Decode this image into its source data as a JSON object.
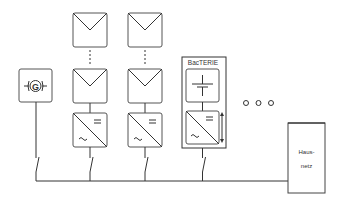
{
  "diagram": {
    "type": "power system schematic",
    "nodes": [
      {
        "id": "generator",
        "kind": "generator",
        "symbol": "G"
      },
      {
        "id": "pv_string_1",
        "kind": "pv_string",
        "modules": 2,
        "inverter": "DC/AC"
      },
      {
        "id": "pv_string_2",
        "kind": "pv_string",
        "modules": 2,
        "inverter": "DC/AC"
      },
      {
        "id": "battery_unit",
        "kind": "battery_system",
        "label": "BacTERIE",
        "inverter": "DC/AC bidirectional"
      },
      {
        "id": "more",
        "kind": "ellipsis",
        "label": "o o o"
      },
      {
        "id": "grid",
        "kind": "house_grid",
        "label_line1": "Haus-",
        "label_line2": "netz"
      }
    ],
    "edges": [
      {
        "from": "generator",
        "to": "bus",
        "switch": true
      },
      {
        "from": "pv_string_1",
        "to": "bus",
        "switch": true
      },
      {
        "from": "pv_string_2",
        "to": "bus",
        "switch": true
      },
      {
        "from": "battery_unit",
        "to": "bus",
        "switch": true
      },
      {
        "from": "bus",
        "to": "grid"
      }
    ]
  },
  "labels": {
    "generator_symbol": "G",
    "battery_label": "BacTERIE",
    "dc_symbol": "=",
    "ac_symbol": "~",
    "grid_line1": "Haus-",
    "grid_line2": "netz",
    "ellipsis": "○ ○ ○"
  },
  "colors": {
    "line": "#333333",
    "box_border": "#555555",
    "background": "#ffffff"
  }
}
